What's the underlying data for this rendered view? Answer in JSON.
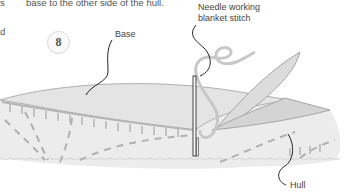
{
  "text_fragments": {
    "left_top": "s",
    "left_mid": "d",
    "body_line": "base to the other side of the hull."
  },
  "step_number": "8",
  "labels": {
    "needle": "Needle working\nblanket stitch",
    "base": "Base",
    "hull": "Hull"
  },
  "colors": {
    "fabric": "#e9e9e9",
    "stitch": "#a8a8a8",
    "outline": "#9a9a9a",
    "leader": "#222222"
  }
}
